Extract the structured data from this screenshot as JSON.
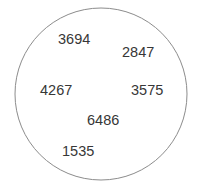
{
  "figure": {
    "kind": "single-set-venn-diagram",
    "background_color": "#ffffff",
    "circle": {
      "name": "set-circle",
      "stroke_color": "#8c8c8c",
      "fill_color": "#ffffff",
      "stroke_width": 1,
      "center_x": 101,
      "center_y": 94,
      "radius": 86
    },
    "label_color": "#373737",
    "elements": [
      {
        "value": "3694",
        "x": 58,
        "y": 32
      },
      {
        "value": "2847",
        "x": 122,
        "y": 45
      },
      {
        "value": "4267",
        "x": 40,
        "y": 83
      },
      {
        "value": "3575",
        "x": 131,
        "y": 83
      },
      {
        "value": "6486",
        "x": 87,
        "y": 113
      },
      {
        "value": "1535",
        "x": 62,
        "y": 144
      }
    ]
  }
}
